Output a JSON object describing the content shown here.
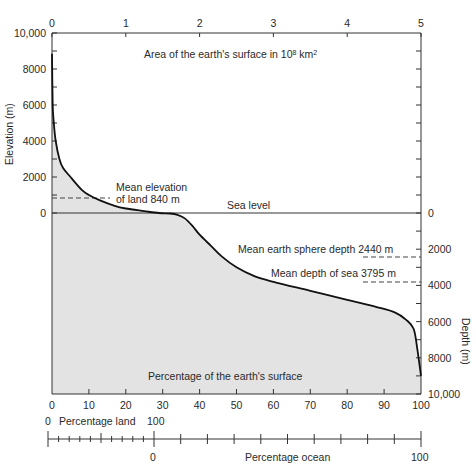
{
  "chart_data": {
    "type": "area",
    "top_axis": {
      "label": "Area of the earth's surface in 10⁸ km²",
      "label_main": "Area of the earth's surface in 10",
      "label_exp": "8",
      "label_unit": " km",
      "label_unit_exp": "2",
      "ticks": [
        "0",
        "1",
        "2",
        "3",
        "4",
        "5"
      ],
      "range": [
        0,
        5.1
      ]
    },
    "left_axis": {
      "label": "Elevation (m)",
      "ticks": [
        "10,000",
        "8000",
        "6000",
        "4000",
        "2000",
        "0"
      ],
      "range": [
        0,
        10000
      ]
    },
    "right_axis": {
      "label": "Depth (m)",
      "ticks": [
        "0",
        "2000",
        "4000",
        "6000",
        "8000",
        "10,000"
      ],
      "range": [
        0,
        10000
      ]
    },
    "bottom_axis": {
      "label": "Percentage of the earth's surface",
      "ticks": [
        "0",
        "10",
        "20",
        "30",
        "40",
        "50",
        "60",
        "70",
        "80",
        "90",
        "100"
      ],
      "range": [
        0,
        100
      ]
    },
    "land_scale": {
      "label": "Percentage land",
      "start": "0",
      "end": "100"
    },
    "ocean_scale": {
      "label": "Percentage ocean",
      "start": "0",
      "end": "100"
    },
    "annotations": {
      "sea_level": "Sea level",
      "mean_land_line1": "Mean elevation",
      "mean_land_line2": "of land 840 m",
      "mean_sphere": "Mean earth sphere depth 2440 m",
      "mean_sea": "Mean depth of sea 3795 m"
    },
    "reference_lines": [
      {
        "name": "Mean elevation of land",
        "value_m": 840
      },
      {
        "name": "Mean earth sphere depth",
        "value_m": -2440
      },
      {
        "name": "Mean depth of sea",
        "value_m": -3795
      }
    ],
    "series": [
      {
        "name": "Cumulative elevation/depth",
        "x_percent": [
          0,
          0.2,
          0.5,
          1,
          2,
          3,
          5,
          8,
          10,
          13,
          17,
          20,
          25,
          29,
          32,
          34,
          36,
          38,
          40,
          43,
          46,
          50,
          55,
          60,
          70,
          80,
          88,
          93,
          96,
          98,
          99,
          100
        ],
        "elevation_m": [
          8848,
          6000,
          5000,
          4000,
          3000,
          2500,
          2000,
          1300,
          1000,
          700,
          400,
          250,
          100,
          0,
          -30,
          -100,
          -300,
          -700,
          -1200,
          -1800,
          -2400,
          -3000,
          -3500,
          -3800,
          -4300,
          -4800,
          -5200,
          -5500,
          -5900,
          -6400,
          -7500,
          -9000
        ]
      }
    ],
    "colors": {
      "fill": "#e3e3e3",
      "curve": "#111111",
      "axis": "#333333"
    }
  }
}
